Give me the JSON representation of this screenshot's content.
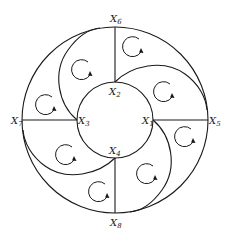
{
  "diagram": {
    "type": "annular-flow-cells",
    "outer_circle": {
      "cx": 115,
      "cy": 120,
      "r": 93
    },
    "inner_circle": {
      "cx": 115,
      "cy": 120,
      "r": 38
    },
    "colors": {
      "line": "#1a1a1a",
      "background": "#ffffff"
    },
    "labels": [
      {
        "id": "x1",
        "text": "X",
        "sub": "1",
        "x": 142,
        "y": 124
      },
      {
        "id": "x2",
        "text": "X",
        "sub": "2",
        "x": 109,
        "y": 94
      },
      {
        "id": "x3",
        "text": "X",
        "sub": "3",
        "x": 78,
        "y": 124
      },
      {
        "id": "x4",
        "text": "X",
        "sub": "4",
        "x": 109,
        "y": 153
      },
      {
        "id": "x5",
        "text": "X",
        "sub": "5",
        "x": 209,
        "y": 124
      },
      {
        "id": "x6",
        "text": "X",
        "sub": "6",
        "x": 110,
        "y": 22
      },
      {
        "id": "x7",
        "text": "X",
        "sub": "7",
        "x": 12,
        "y": 124
      },
      {
        "id": "x8",
        "text": "X",
        "sub": "8",
        "x": 110,
        "y": 226
      }
    ],
    "radial_lines": [
      {
        "from": "X6",
        "to": "X2"
      },
      {
        "from": "X7",
        "to": "X3"
      },
      {
        "from": "X1",
        "to": "X5"
      },
      {
        "from": "X4",
        "to": "X8"
      }
    ],
    "spiral_arcs": [
      {
        "from": "X3",
        "to": "outer-top"
      },
      {
        "from": "X2",
        "to": "outer-right"
      },
      {
        "from": "X1",
        "to": "outer-bottom"
      },
      {
        "from": "X4",
        "to": "outer-left"
      }
    ],
    "circulation_arrows_count": 8
  }
}
